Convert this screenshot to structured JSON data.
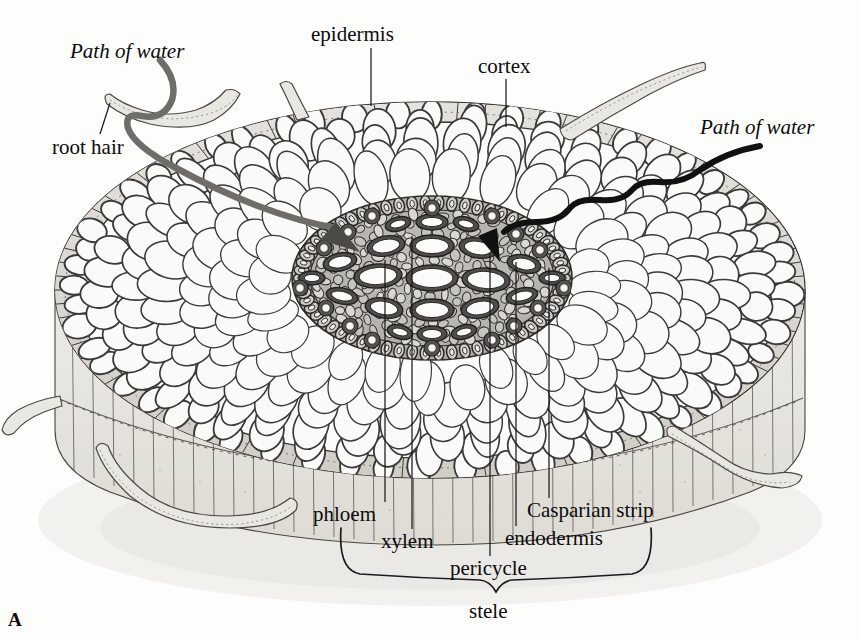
{
  "figure": {
    "panel_letter": "A",
    "background_color": "#fdfdfc",
    "ink_color": "#1a1a1a"
  },
  "labels": {
    "epidermis": "epidermis",
    "cortex": "cortex",
    "root_hair": "root hair",
    "path_of_water_left": "Path of water",
    "path_of_water_right": "Path of water",
    "phloem": "phloem",
    "xylem": "xylem",
    "pericycle": "pericycle",
    "endodermis": "endodermis",
    "casparian_strip": "Casparian strip",
    "stele": "stele"
  },
  "label_positions": {
    "epidermis": {
      "x": 311,
      "y": 26
    },
    "cortex": {
      "x": 478,
      "y": 57
    },
    "root_hair": {
      "x": 52,
      "y": 139
    },
    "path_of_water_left": {
      "x": 70,
      "y": 52
    },
    "path_of_water_right": {
      "x": 700,
      "y": 127
    },
    "phloem": {
      "x": 313,
      "y": 507
    },
    "xylem": {
      "x": 381,
      "y": 534
    },
    "pericycle": {
      "x": 450,
      "y": 561
    },
    "endodermis": {
      "x": 505,
      "y": 531
    },
    "casparian_strip": {
      "x": 527,
      "y": 503
    },
    "stele": {
      "x": 469,
      "y": 604
    },
    "panel_letter": {
      "x": 8,
      "y": 612
    }
  },
  "leader_lines": [
    {
      "name": "epidermis-leader",
      "x1": 371,
      "y1": 48,
      "x2": 371,
      "y2": 106
    },
    {
      "name": "cortex-leader",
      "x1": 506,
      "y1": 79,
      "x2": 506,
      "y2": 127
    },
    {
      "name": "root-hair-leader",
      "x1": 100,
      "y1": 134,
      "x2": 108,
      "y2": 104
    },
    {
      "name": "phloem-leader",
      "x1": 385,
      "y1": 260,
      "x2": 385,
      "y2": 502
    },
    {
      "name": "xylem-leader",
      "x1": 412,
      "y1": 236,
      "x2": 412,
      "y2": 529
    },
    {
      "name": "pericycle-leader",
      "x1": 490,
      "y1": 253,
      "x2": 490,
      "y2": 556
    },
    {
      "name": "endodermis-leader",
      "x1": 516,
      "y1": 262,
      "x2": 516,
      "y2": 526
    },
    {
      "name": "casparian-leader",
      "x1": 549,
      "y1": 268,
      "x2": 549,
      "y2": 498
    }
  ],
  "structures": {
    "stele_brace": {
      "left_x": 340,
      "right_x": 652,
      "top_y": 528,
      "bottom_y": 592
    },
    "water_paths": [
      {
        "name": "apoplastic-left",
        "side": "left",
        "color": "#5a5a5a"
      },
      {
        "name": "apoplastic-right",
        "side": "right",
        "color": "#111111"
      }
    ],
    "root_hairs_count": 5,
    "tissue_layers": [
      "epidermis",
      "cortex",
      "endodermis",
      "pericycle",
      "xylem",
      "phloem"
    ]
  },
  "colors": {
    "cell_wall": "#3a3a3a",
    "cell_fill": "#fbfbfa",
    "epidermis_fill": "#dedcd6",
    "cortex_fill": "#fafaf8",
    "stele_fill": "#b9b7b1",
    "side_wall_fill": "#e6e4de",
    "shadow": "#c9c7c1"
  }
}
